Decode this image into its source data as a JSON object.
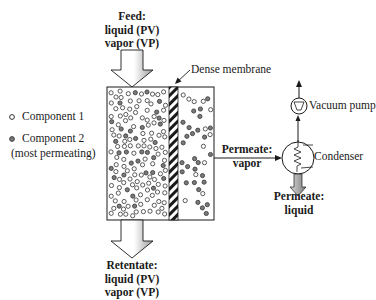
{
  "feed": {
    "title": "Feed:",
    "line1": "liquid (PV)",
    "line2": "vapor (VP)"
  },
  "retentate": {
    "title": "Retentate:",
    "line1": "liquid (PV)",
    "line2": "vapor (VP)"
  },
  "membrane": {
    "label": "Dense membrane"
  },
  "legend": {
    "items": [
      {
        "icon": "open-circle-icon",
        "label": "Component 1"
      },
      {
        "icon": "filled-circle-icon",
        "label": "Component 2"
      }
    ],
    "note": "(most permeating)"
  },
  "permeate_vapor": {
    "title": "Permeate:",
    "line1": "vapor"
  },
  "permeate_liquid": {
    "title": "Permeate:",
    "line1": "liquid"
  },
  "equipment": {
    "vacuum_pump": "Vacuum pump",
    "condenser": "Condenser"
  },
  "colors": {
    "line": "#1a1a1a",
    "filled_particle": "#7a7a7a",
    "open_particle": "#ffffff",
    "arrow_fill_light": "#ffffff",
    "arrow_fill_shade": "#9a9a9a"
  }
}
